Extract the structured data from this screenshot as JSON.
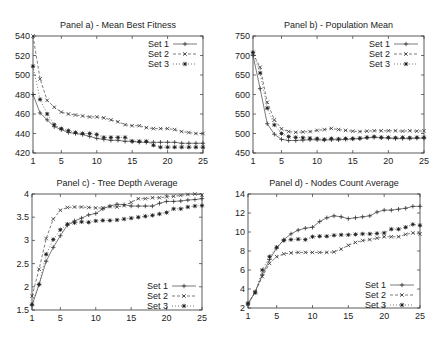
{
  "figure": {
    "width": 447,
    "height": 340,
    "x_ticks": [
      1,
      5,
      10,
      15,
      20,
      25
    ],
    "legend_labels": [
      "Set 1",
      "Set 2",
      "Set 3"
    ]
  },
  "chart_data": [
    {
      "type": "line",
      "title": "Panel a) - Mean Best Fitness",
      "xlabel": "",
      "ylabel": "",
      "xlim": [
        1,
        25
      ],
      "ylim": [
        420,
        540
      ],
      "yticks": [
        420,
        440,
        460,
        480,
        500,
        520,
        540
      ],
      "xticks": [
        1,
        5,
        10,
        15,
        20,
        25
      ],
      "grid": false,
      "legend_position": "top-right",
      "x": [
        1,
        2,
        3,
        4,
        5,
        6,
        7,
        8,
        9,
        10,
        11,
        12,
        13,
        14,
        15,
        16,
        17,
        18,
        19,
        20,
        21,
        22,
        23,
        24,
        25
      ],
      "series": [
        {
          "name": "Set 1",
          "values": [
            480,
            461,
            454,
            447,
            444,
            441,
            440,
            439,
            437,
            435,
            434,
            433,
            433,
            432,
            432,
            431,
            431,
            431,
            431,
            431,
            431,
            430,
            430,
            430,
            430
          ]
        },
        {
          "name": "Set 2",
          "values": [
            540,
            496,
            474,
            467,
            462,
            460,
            459,
            458,
            457,
            457,
            456,
            454,
            452,
            449,
            448,
            448,
            446,
            445,
            445,
            445,
            444,
            442,
            441,
            440,
            440
          ]
        },
        {
          "name": "Set 3",
          "values": [
            509,
            475,
            460,
            449,
            445,
            443,
            441,
            440,
            440,
            439,
            436,
            436,
            436,
            436,
            432,
            432,
            432,
            428,
            426,
            426,
            426,
            426,
            426,
            426,
            426
          ]
        }
      ]
    },
    {
      "type": "line",
      "title": "Panel b) - Population Mean",
      "xlabel": "",
      "ylabel": "",
      "xlim": [
        1,
        25
      ],
      "ylim": [
        450,
        750
      ],
      "yticks": [
        450,
        500,
        550,
        600,
        650,
        700,
        750
      ],
      "xticks": [
        1,
        5,
        10,
        15,
        20,
        25
      ],
      "grid": false,
      "legend_position": "top-right",
      "x": [
        1,
        2,
        3,
        4,
        5,
        6,
        7,
        8,
        9,
        10,
        11,
        12,
        13,
        14,
        15,
        16,
        17,
        18,
        19,
        20,
        21,
        22,
        23,
        24,
        25
      ],
      "series": [
        {
          "name": "Set 1",
          "values": [
            700,
            615,
            525,
            498,
            485,
            482,
            482,
            483,
            484,
            484,
            483,
            484,
            484,
            485,
            486,
            487,
            489,
            490,
            489,
            488,
            487,
            487,
            487,
            488,
            488
          ]
        },
        {
          "name": "Set 2",
          "values": [
            705,
            670,
            580,
            535,
            512,
            505,
            503,
            504,
            505,
            508,
            510,
            513,
            510,
            508,
            506,
            505,
            506,
            507,
            507,
            507,
            507,
            506,
            507,
            506,
            507
          ]
        },
        {
          "name": "Set 3",
          "values": [
            708,
            655,
            565,
            522,
            500,
            492,
            490,
            489,
            488,
            487,
            485,
            487,
            486,
            487,
            487,
            488,
            490,
            492,
            490,
            490,
            489,
            490,
            489,
            490,
            490
          ]
        }
      ]
    },
    {
      "type": "line",
      "title": "Panel c) - Tree Depth Average",
      "xlabel": "",
      "ylabel": "",
      "xlim": [
        1,
        25
      ],
      "ylim": [
        1.5,
        4
      ],
      "yticks": [
        1.5,
        2,
        2.5,
        3,
        3.5,
        4
      ],
      "xticks": [
        1,
        5,
        10,
        15,
        20,
        25
      ],
      "grid": false,
      "legend_position": "bottom-right",
      "x": [
        1,
        2,
        3,
        4,
        5,
        6,
        7,
        8,
        9,
        10,
        11,
        12,
        13,
        14,
        15,
        16,
        17,
        18,
        19,
        20,
        21,
        22,
        23,
        24,
        25
      ],
      "series": [
        {
          "name": "Set 1",
          "values": [
            1.6,
            2.05,
            2.55,
            2.85,
            3.1,
            3.33,
            3.42,
            3.48,
            3.55,
            3.58,
            3.68,
            3.74,
            3.78,
            3.77,
            3.74,
            3.74,
            3.74,
            3.74,
            3.8,
            3.84,
            3.84,
            3.85,
            3.87,
            3.88,
            3.9
          ]
        },
        {
          "name": "Set 2",
          "values": [
            1.8,
            2.38,
            3.04,
            3.46,
            3.65,
            3.71,
            3.72,
            3.72,
            3.71,
            3.7,
            3.7,
            3.73,
            3.72,
            3.75,
            3.82,
            3.9,
            3.9,
            3.92,
            3.92,
            3.94,
            3.95,
            3.97,
            3.99,
            4.0,
            3.98
          ]
        },
        {
          "name": "Set 3",
          "values": [
            1.62,
            2.05,
            2.7,
            3.02,
            3.23,
            3.35,
            3.38,
            3.4,
            3.39,
            3.42,
            3.43,
            3.43,
            3.44,
            3.46,
            3.48,
            3.5,
            3.52,
            3.54,
            3.57,
            3.6,
            3.68,
            3.68,
            3.72,
            3.74,
            3.75
          ]
        }
      ]
    },
    {
      "type": "line",
      "title": "Panel d) - Nodes Count Average",
      "xlabel": "",
      "ylabel": "",
      "xlim": [
        1,
        25
      ],
      "ylim": [
        2,
        14
      ],
      "yticks": [
        2,
        4,
        6,
        8,
        10,
        12,
        14
      ],
      "xticks": [
        1,
        5,
        10,
        15,
        20,
        25
      ],
      "grid": false,
      "legend_position": "bottom-right",
      "x": [
        1,
        2,
        3,
        4,
        5,
        6,
        7,
        8,
        9,
        10,
        11,
        12,
        13,
        14,
        15,
        16,
        17,
        18,
        19,
        20,
        21,
        22,
        23,
        24,
        25
      ],
      "series": [
        {
          "name": "Set 1",
          "values": [
            2.4,
            3.7,
            5.5,
            7.1,
            8.3,
            9.2,
            9.8,
            10.2,
            10.4,
            10.5,
            11.1,
            11.5,
            11.7,
            11.6,
            11.4,
            11.5,
            11.6,
            11.7,
            12.1,
            12.3,
            12.3,
            12.4,
            12.5,
            12.7,
            12.7
          ]
        },
        {
          "name": "Set 2",
          "values": [
            2.4,
            3.7,
            5.3,
            6.7,
            7.4,
            7.7,
            7.8,
            7.85,
            7.85,
            7.85,
            7.85,
            7.85,
            7.9,
            8.2,
            8.6,
            8.9,
            9.1,
            9.2,
            9.35,
            9.5,
            9.5,
            9.5,
            9.75,
            9.9,
            9.8
          ]
        },
        {
          "name": "Set 3",
          "values": [
            2.5,
            3.6,
            6.0,
            7.4,
            8.4,
            9.1,
            9.2,
            9.25,
            9.2,
            9.5,
            9.55,
            9.55,
            9.65,
            9.7,
            9.7,
            9.75,
            9.8,
            9.8,
            9.85,
            9.9,
            10.3,
            10.3,
            10.5,
            10.8,
            10.7
          ]
        }
      ]
    }
  ]
}
